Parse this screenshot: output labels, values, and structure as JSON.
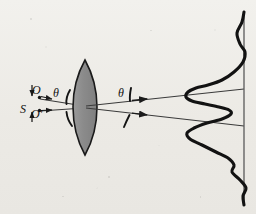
{
  "figure": {
    "name": "interference-optics-diagram",
    "type": "optical ray diagram with intensity pattern",
    "background_color": "#efeeea",
    "ink_color": "#111111",
    "lens_fill_color": "#8d8d8d",
    "lens_stroke_color": "#1a1a1a",
    "ray_color": "#3a3a3a",
    "curve_color": "#121212",
    "screen_color": "#5a5a5a"
  },
  "labels": {
    "source": "S",
    "image_upper": "O",
    "image_lower": "O'",
    "angle_in": "θ",
    "angle_out": "θ"
  },
  "elements": {
    "lens_name": "biconvex-lens",
    "screen_name": "observation-screen",
    "pattern_name": "interference-intensity-profile",
    "ray_upper_name": "ray-upper",
    "ray_lower_name": "ray-lower"
  },
  "geometry": {
    "source_point": [
      38,
      108
    ],
    "point_O": [
      39,
      97
    ],
    "point_O_prime": [
      39,
      110
    ],
    "lens_center": [
      85,
      107
    ],
    "lens_top": [
      85,
      60
    ],
    "lens_bottom": [
      85,
      155
    ],
    "lens_half_width": 12,
    "screen_x": 244,
    "screen_top": 12,
    "screen_bottom": 205,
    "ray_upper_end": [
      244,
      89
    ],
    "ray_lower_end": [
      244,
      126
    ],
    "arrow_upper": [
      147,
      97
    ],
    "arrow_lower": [
      147,
      117
    ]
  },
  "chart_data": {
    "type": "line",
    "title": "",
    "xlabel": "",
    "ylabel": "",
    "orientation": "vertical-screen-intensity",
    "baseline_x": 244,
    "ylim": [
      12,
      205
    ],
    "xlim": [
      180,
      248
    ],
    "points": [
      [
        244,
        12
      ],
      [
        242,
        22
      ],
      [
        237,
        33
      ],
      [
        240,
        44
      ],
      [
        245,
        52
      ],
      [
        243,
        62
      ],
      [
        234,
        72
      ],
      [
        222,
        80
      ],
      [
        208,
        85
      ],
      [
        196,
        88
      ],
      [
        188,
        92
      ],
      [
        186,
        97
      ],
      [
        192,
        101
      ],
      [
        205,
        104
      ],
      [
        219,
        107
      ],
      [
        229,
        110
      ],
      [
        231,
        114
      ],
      [
        222,
        119
      ],
      [
        207,
        123
      ],
      [
        194,
        128
      ],
      [
        187,
        133
      ],
      [
        190,
        139
      ],
      [
        202,
        145
      ],
      [
        216,
        152
      ],
      [
        228,
        158
      ],
      [
        234,
        165
      ],
      [
        232,
        172
      ],
      [
        240,
        180
      ],
      [
        246,
        188
      ],
      [
        243,
        196
      ],
      [
        244,
        205
      ]
    ],
    "peaks": [
      {
        "y": 92,
        "x_extent": 186,
        "order": "principal-maximum-upper"
      },
      {
        "y": 133,
        "x_extent": 187,
        "order": "principal-maximum-lower"
      },
      {
        "y": 72,
        "x_extent": 234,
        "order": "secondary-maximum-upper"
      },
      {
        "y": 165,
        "x_extent": 234,
        "order": "secondary-maximum-lower"
      },
      {
        "y": 33,
        "x_extent": 237,
        "order": "tertiary-maximum-upper"
      },
      {
        "y": 196,
        "x_extent": 243,
        "order": "tertiary-maximum-lower"
      }
    ]
  }
}
